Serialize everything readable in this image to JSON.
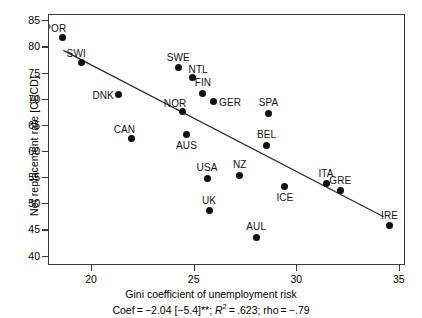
{
  "chart_data": {
    "type": "scatter",
    "title": "",
    "xlabel": "Gini coefficient of unemployment risk",
    "ylabel": "Net replacement rate [OECD]",
    "xlim": [
      17.9,
      35.3
    ],
    "ylim": [
      38.2,
      86.2
    ],
    "xticks": [
      20,
      25,
      30,
      35
    ],
    "yticks": [
      40,
      45,
      50,
      55,
      60,
      65,
      70,
      75,
      80,
      85
    ],
    "grid": false,
    "legend": null,
    "annotation": "Coef = −2.04 [−5.4]**; R² = .623; rho = −.79",
    "annotation_parts": {
      "coef_prefix": "Coef = −2.04 [−5.4]**; ",
      "r_symbol": "R",
      "r_exponent": "2",
      "r_value": " = .623; ",
      "rho": "rho = −.79"
    },
    "fit_line": {
      "x0": 18.6,
      "y0": 79.4,
      "x1": 34.3,
      "y1": 47.4
    },
    "points": [
      {
        "label": "POR",
        "x": 18.55,
        "y": 82.0,
        "label_pos": "topleft"
      },
      {
        "label": "SWI",
        "x": 19.5,
        "y": 77.2,
        "label_pos": "topleft"
      },
      {
        "label": "DNK",
        "x": 21.3,
        "y": 71.0,
        "label_pos": "left"
      },
      {
        "label": "CAN",
        "x": 21.9,
        "y": 62.6,
        "label_pos": "topleft"
      },
      {
        "label": "SWE",
        "x": 24.2,
        "y": 76.1,
        "label_pos": "top"
      },
      {
        "label": "NTL",
        "x": 24.9,
        "y": 74.2,
        "label_pos": "topright"
      },
      {
        "label": "NOR",
        "x": 24.4,
        "y": 67.7,
        "label_pos": "topleft"
      },
      {
        "label": "FIN",
        "x": 25.4,
        "y": 71.2,
        "label_pos": "top"
      },
      {
        "label": "GER",
        "x": 25.9,
        "y": 69.6,
        "label_pos": "right"
      },
      {
        "label": "AUS",
        "x": 24.6,
        "y": 63.3,
        "label_pos": "bottom"
      },
      {
        "label": "USA",
        "x": 25.6,
        "y": 55.0,
        "label_pos": "top"
      },
      {
        "label": "UK",
        "x": 25.7,
        "y": 48.8,
        "label_pos": "top"
      },
      {
        "label": "NZ",
        "x": 27.2,
        "y": 55.6,
        "label_pos": "top"
      },
      {
        "label": "AUL",
        "x": 28.0,
        "y": 43.7,
        "label_pos": "top"
      },
      {
        "label": "SPA",
        "x": 28.6,
        "y": 67.4,
        "label_pos": "top"
      },
      {
        "label": "BEL",
        "x": 28.5,
        "y": 61.3,
        "label_pos": "top"
      },
      {
        "label": "ICE",
        "x": 29.4,
        "y": 53.4,
        "label_pos": "bottom"
      },
      {
        "label": "ITA",
        "x": 31.4,
        "y": 53.9,
        "label_pos": "top"
      },
      {
        "label": "GRE",
        "x": 32.1,
        "y": 52.6,
        "label_pos": "top"
      },
      {
        "label": "IRE",
        "x": 34.5,
        "y": 45.9,
        "label_pos": "top"
      }
    ]
  }
}
